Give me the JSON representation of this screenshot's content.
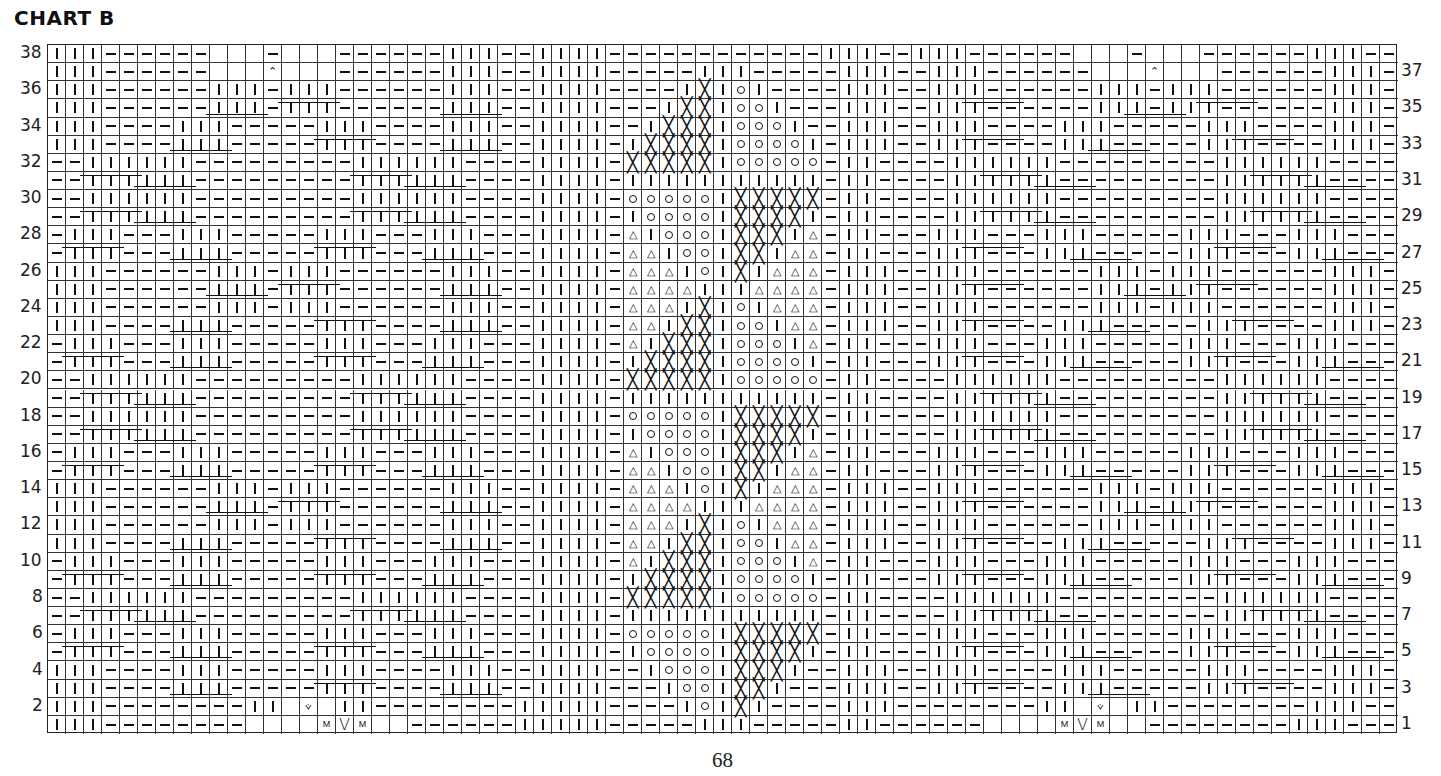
{
  "title": "CHART B",
  "page_number": "68",
  "grid": {
    "columns": 75,
    "rows": 38,
    "legend_symbols": {
      "|": "knit-stitch",
      "-": "purl-stitch",
      ".": "no-stitch",
      "X": "cross-symbol",
      "o": "circle-symbol",
      "A": "triangle-symbol",
      "^": "decrease-symbol",
      "v": "small-v-symbol",
      "V": "large-v-symbol",
      "M": "make-one-symbol"
    }
  },
  "row_numbers_left": [
    "38",
    "36",
    "34",
    "32",
    "30",
    "28",
    "26",
    "24",
    "22",
    "20",
    "18",
    "16",
    "14",
    "12",
    "10",
    "8",
    "6",
    "4",
    "2"
  ],
  "row_numbers_right": [
    "37",
    "35",
    "33",
    "31",
    "29",
    "27",
    "25",
    "23",
    "21",
    "19",
    "17",
    "15",
    "13",
    "11",
    "9",
    "7",
    "5",
    "3",
    "1"
  ],
  "chart_data": {
    "type": "table",
    "title": "CHART B",
    "rows": [
      {
        "row": 38,
        "left": "|||------...-...------|||--|",
        "center": "|||------------|",
        "right": "||--|||------...-...------|||"
      },
      {
        "row": 37,
        "left": "|||------...^...------|||--|",
        "center": "|||-----|||-----|",
        "right": "||--|||------...^...------|||"
      },
      {
        "row": 36,
        "left": "|||------|||-|||------|||--|",
        "center": "|||----|X|o|----|",
        "right": "||--|||------|||-|||------|||"
      },
      {
        "row": 35,
        "left": "|||------|||-|||------|||--|",
        "center": "|||---|XX|oo|---|",
        "right": "||--|||------|||-|||------|||"
      },
      {
        "row": 34,
        "left": "|||----|||-----|||----|||--|",
        "center": "|||--|XXX|ooo|--|",
        "right": "||--|||----|||-----|||----|||"
      },
      {
        "row": 33,
        "left": "|||----|||-----|||----|||--|",
        "center": "|||-|XXXX|oooo|-|",
        "right": "||--|||----|||-----|||----|||"
      },
      {
        "row": 32,
        "left": "--||||||---------||||||----|",
        "center": "|||-XXXXX|ooooo-|",
        "right": "|----||||||---------||||||--"
      },
      {
        "row": 31,
        "left": "--||||||---------||||||----|",
        "center": "|||-|||||||||||-|",
        "right": "|----||||||---------||||||--"
      },
      {
        "row": 30,
        "left": "--||||||---------||||||----|",
        "center": "|||-ooooo|XXXXX-|",
        "right": "|----||||||---------||||||--"
      },
      {
        "row": 29,
        "left": "--||||||---------||||||----|",
        "center": "|||-|oooo|XXXX|-|",
        "right": "|----||||||---------||||||--"
      },
      {
        "row": 28,
        "left": "-|||---|||-----|||---|||---|",
        "center": "|||-A|ooo|XXX|A-|",
        "right": "|---|||---|||-----|||---|||-"
      },
      {
        "row": 27,
        "left": "-|||---|||-----|||---|||---|",
        "center": "|||-AA|oo|XX|AA-|",
        "right": "|---|||---|||-----|||---|||-"
      },
      {
        "row": 26,
        "left": "|||------|||-|||------|||--|",
        "center": "|||-AAA|o|X|AAA-|",
        "right": "||--|||------|||-|||------|||"
      },
      {
        "row": 25,
        "left": "|||------|||-|||------|||--|",
        "center": "|||-AAAA|||AAAA-|",
        "right": "||--|||------|||-|||------|||"
      },
      {
        "row": 24,
        "left": "|||------|||-|||------|||--|",
        "center": "|||-AAA|X|o|AAA-|",
        "right": "||--|||------|||-|||------|||"
      },
      {
        "row": 23,
        "left": "|||----|||-----|||----|||--|",
        "center": "|||-AA|XX|oo|AA-|",
        "right": "||--|||----|||-----|||----|||"
      },
      {
        "row": 22,
        "left": "-|||---|||-----|||---|||---|",
        "center": "|||-A|XXX|ooo|A-|",
        "right": "|---|||---|||-----|||---|||-"
      },
      {
        "row": 21,
        "left": "-|||---|||-----|||---|||---|",
        "center": "|||-|XXXX|oooo|-|",
        "right": "|---|||---|||-----|||---|||-"
      },
      {
        "row": 20,
        "left": "--||||||---------||||||----|",
        "center": "|||-XXXXX|ooooo-|",
        "right": "|----||||||---------||||||--"
      },
      {
        "row": 19,
        "left": "--||||||---------||||||----|",
        "center": "|||-|||||||||||-|",
        "right": "|----||||||---------||||||--"
      },
      {
        "row": 18,
        "left": "--||||||---------||||||----|",
        "center": "|||-ooooo|XXXXX-|",
        "right": "|----||||||---------||||||--"
      },
      {
        "row": 17,
        "left": "--||||||---------||||||----|",
        "center": "|||-|oooo|XXXX|-|",
        "right": "|----||||||---------||||||--"
      },
      {
        "row": 16,
        "left": "-|||---|||-----|||---|||---|",
        "center": "|||-A|ooo|XXX|A-|",
        "right": "|---|||---|||-----|||---|||-"
      },
      {
        "row": 15,
        "left": "-|||---|||-----|||---|||---|",
        "center": "|||-AA|oo|XX|AA-|",
        "right": "|---|||---|||-----|||---|||-"
      },
      {
        "row": 14,
        "left": "|||------|||-|||------|||--|",
        "center": "|||-AAA|o|X|AAA-|",
        "right": "||--|||------|||-|||------|||"
      },
      {
        "row": 13,
        "left": "|||------|||-|||------|||--|",
        "center": "|||-AAAA|||AAAA-|",
        "right": "||--|||------|||-|||------|||"
      },
      {
        "row": 12,
        "left": "|||------|||-|||------|||--|",
        "center": "|||-AAA|X|o|AAA-|",
        "right": "||--|||------|||-|||------|||"
      },
      {
        "row": 11,
        "left": "|||----|||-----|||----|||--|",
        "center": "|||-AA|XX|oo|AA-|",
        "right": "||--|||----|||-----|||----|||"
      },
      {
        "row": 10,
        "left": "-|||---|||-----|||---|||---|",
        "center": "|||-A|XXX|ooo|A-|",
        "right": "|---|||---|||-----|||---|||-"
      },
      {
        "row": 9,
        "left": "-|||---|||-----|||---|||---|",
        "center": "|||-|XXXX|oooo|-|",
        "right": "|---|||---|||-----|||---|||-"
      },
      {
        "row": 8,
        "left": "--||||||---------||||||----|",
        "center": "|||-XXXXX|ooooo-|",
        "right": "|----||||||---------||||||--"
      },
      {
        "row": 7,
        "left": "--||||||---------||||||----|",
        "center": "|||-|||||||||||-|",
        "right": "|----||||||---------||||||--"
      },
      {
        "row": 6,
        "left": "-|||---|||-----|||---|||---|",
        "center": "|||-ooooo|XXXXX-|",
        "right": "|---|||---|||-----|||---|||-"
      },
      {
        "row": 5,
        "left": "-|||---|||-----|||---|||---|",
        "center": "|||-|oooo|XXXX|-|",
        "right": "|---|||---|||-----|||---|||-"
      },
      {
        "row": 4,
        "left": "|||----|||-----|||----|||--|",
        "center": "|||--|ooo|XXX|--|",
        "right": "||--|||----|||-----|||----|||"
      },
      {
        "row": 3,
        "left": "|||----|||-----|||----|||--|",
        "center": "|||---|oo|XX|---|",
        "right": "||--|||----|||-----|||----|||"
      },
      {
        "row": 2,
        "left": "|||--------||.v.||--------||",
        "center": "|||----|o|X|----|",
        "right": "||--------||.v.||--------|||"
      },
      {
        "row": 1,
        "left": "|||--------....MVM..------||",
        "center": "|||-----|||-----|",
        "right": "|------....MVM..--------|||"
      }
    ],
    "cable_rows": [
      35,
      33,
      31,
      29,
      27,
      25,
      23,
      21,
      19,
      17,
      15,
      13,
      11,
      9,
      7,
      5,
      3
    ]
  }
}
